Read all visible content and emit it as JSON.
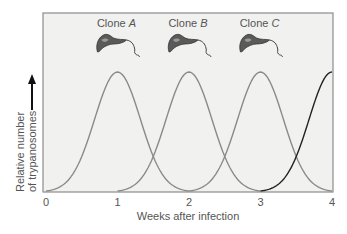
{
  "chart_data": {
    "type": "line",
    "title": "",
    "xlabel": "Weeks after infection",
    "ylabel": "Relative number of trypanosomes",
    "ylabel_lines": [
      "Relative number",
      "of trypanosomes"
    ],
    "ylabel_has_up_arrow": true,
    "x_ticks": [
      0,
      1,
      2,
      3,
      4
    ],
    "xlim": [
      0,
      4
    ],
    "ylim": [
      0,
      1.15
    ],
    "grid": false,
    "legend": "none",
    "annotations": [
      {
        "text_prefix": "Clone ",
        "text_italic": "A",
        "x": 1,
        "icon": "trypanosome-icon"
      },
      {
        "text_prefix": "Clone ",
        "text_italic": "B",
        "x": 2,
        "icon": "trypanosome-icon"
      },
      {
        "text_prefix": "Clone ",
        "text_italic": "C",
        "x": 3,
        "icon": "trypanosome-icon"
      }
    ],
    "series": [
      {
        "name": "Clone A",
        "color": "#8a8a8a",
        "peak_x": 1,
        "peak_y": 1.0,
        "x": [
          0,
          0.5,
          1,
          1.5,
          2
        ],
        "values": [
          0,
          0.45,
          1.0,
          0.35,
          0
        ]
      },
      {
        "name": "Clone B",
        "color": "#8a8a8a",
        "peak_x": 2,
        "peak_y": 1.0,
        "x": [
          1,
          1.5,
          2,
          2.5,
          3
        ],
        "values": [
          0,
          0.35,
          1.0,
          0.35,
          0
        ]
      },
      {
        "name": "Clone C",
        "color": "#8a8a8a",
        "peak_x": 3,
        "peak_y": 1.0,
        "x": [
          2,
          2.5,
          3,
          3.5,
          4
        ],
        "values": [
          0,
          0.35,
          1.0,
          0.35,
          0
        ]
      },
      {
        "name": "Next clone",
        "color": "#222222",
        "peak_x": 4,
        "peak_y": 1.0,
        "x": [
          3,
          3.5,
          4
        ],
        "values": [
          0,
          0.35,
          1.0
        ]
      }
    ]
  },
  "colors": {
    "plot_background": "#f1f1f0",
    "frame": "#8c8c8c",
    "curve": "#8a8a8a",
    "curve_emphasis": "#222222",
    "text": "#555555"
  }
}
